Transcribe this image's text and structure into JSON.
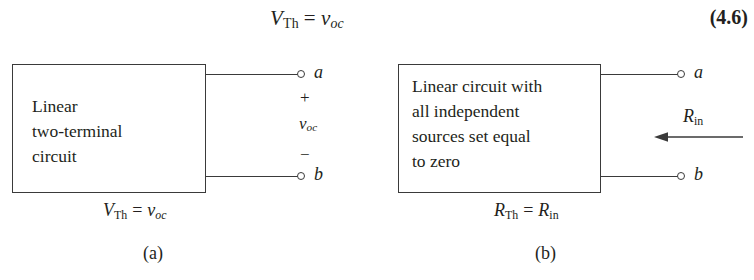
{
  "equation": {
    "lhs_var": "V",
    "lhs_sub": "Th",
    "relation": "=",
    "rhs_var": "v",
    "rhs_sub": "oc",
    "full_text": "V_Th = v_oc",
    "number": "(4.6)"
  },
  "figure_a": {
    "box_text": "Linear\ntwo-terminal\ncircuit",
    "terminal_top_label": "a",
    "terminal_bottom_label": "b",
    "polarity_plus": "+",
    "polarity_minus": "−",
    "voltage_var": "v",
    "voltage_sub": "oc",
    "caption_lhs_var": "V",
    "caption_lhs_sub": "Th",
    "caption_relation": "=",
    "caption_rhs_var": "v",
    "caption_rhs_sub": "oc",
    "caption_full_text": "V_Th = v_oc",
    "subfigure_label": "(a)"
  },
  "figure_b": {
    "box_text": "Linear circuit with\nall independent\nsources set equal\nto zero",
    "terminal_top_label": "a",
    "terminal_bottom_label": "b",
    "resistance_var": "R",
    "resistance_sub": "in",
    "caption_lhs_var": "R",
    "caption_lhs_sub": "Th",
    "caption_relation": "=",
    "caption_rhs_var": "R",
    "caption_rhs_sub": "in",
    "caption_full_text": "R_Th = R_in",
    "subfigure_label": "(b)"
  },
  "colors": {
    "background": "#ffffff",
    "ink": "#231f20",
    "line": "#3a3a3a"
  }
}
